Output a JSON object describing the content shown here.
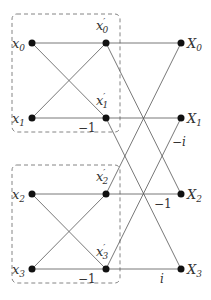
{
  "inputs": [
    "x0",
    "x1",
    "x2",
    "x3"
  ],
  "intermediate": [
    "x'0",
    "x'1",
    "x'2",
    "x'3"
  ],
  "outputs": [
    "X0",
    "X1",
    "X2",
    "X3"
  ],
  "weights": {
    "stage1_a": "−1",
    "stage1_b": "−1",
    "stage2_x1": "−i",
    "stage2_x2": "−1",
    "stage2_x3": "i"
  },
  "colors": {
    "line": "#555555",
    "node": "#111111",
    "box": "#666666"
  }
}
